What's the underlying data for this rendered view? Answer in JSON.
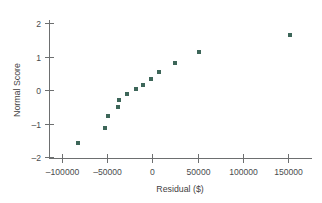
{
  "chart_data": {
    "type": "scatter",
    "title": "",
    "subtitle": "",
    "xlabel": "Residual ($)",
    "ylabel": "Normal Score",
    "xlim": [
      -118000,
      175000
    ],
    "ylim": [
      -2.15,
      2.35
    ],
    "grid": false,
    "legend": null,
    "xticks": [
      -100000,
      -50000,
      0,
      50000,
      100000,
      150000
    ],
    "xtick_labels": [
      "-100000",
      "-50000",
      "0",
      "50000",
      "100000",
      "150000"
    ],
    "yticks": [
      -2,
      -1,
      0,
      1,
      2
    ],
    "ytick_labels": [
      "-2",
      "-1",
      "0",
      "1",
      "2"
    ],
    "marker": {
      "shape": "square",
      "size_px": 4,
      "color": "#3d6659"
    },
    "series": [
      {
        "name": "Residuals",
        "points": [
          {
            "x": -82000,
            "y": -1.58
          },
          {
            "x": -52500,
            "y": -1.12
          },
          {
            "x": -49000,
            "y": -0.78
          },
          {
            "x": -38000,
            "y": -0.51
          },
          {
            "x": -37000,
            "y": -0.3
          },
          {
            "x": -28000,
            "y": -0.12
          },
          {
            "x": -18000,
            "y": 0.02
          },
          {
            "x": -10000,
            "y": 0.16
          },
          {
            "x": -2000,
            "y": 0.33
          },
          {
            "x": 7000,
            "y": 0.55
          },
          {
            "x": 25000,
            "y": 0.8
          },
          {
            "x": 52000,
            "y": 1.12
          },
          {
            "x": 152000,
            "y": 1.65
          }
        ]
      }
    ]
  },
  "colors": {
    "marker": "#3d6659",
    "axis": "#6d6f70",
    "text": "#3f4142",
    "background": "#ffffff"
  }
}
